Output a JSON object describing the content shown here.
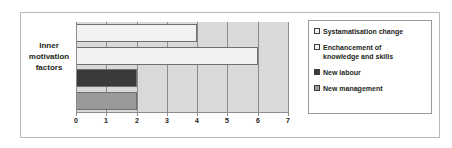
{
  "chart_data": {
    "type": "bar",
    "orientation": "horizontal",
    "title": "",
    "xlabel": "",
    "ylabel": "",
    "categories": [
      "Inner motivation factors"
    ],
    "series": [
      {
        "name": "Systamatisation change",
        "values": [
          4
        ],
        "color": "#f2f2f2"
      },
      {
        "name": "Enchancement of knowledge and skills",
        "values": [
          6
        ],
        "color": "#f2f2f2"
      },
      {
        "name": "New labour",
        "values": [
          2
        ],
        "color": "#3a3a3a"
      },
      {
        "name": "New management",
        "values": [
          2
        ],
        "color": "#9a9a9a"
      }
    ],
    "xlim": [
      0,
      7
    ],
    "xticks": [
      0,
      1,
      2,
      3,
      4,
      5,
      6,
      7
    ],
    "xtick_labels": [
      "0",
      "1",
      "2",
      "3",
      "4",
      "5",
      "6",
      "7"
    ],
    "grid": true,
    "grid_axis": "x",
    "legend_position": "right",
    "plot_background": "#d9d9d9"
  },
  "axis": {
    "category_label_lines": [
      "Inner",
      "motivation",
      "factors"
    ],
    "tick_labels": [
      "0",
      "1",
      "2",
      "3",
      "4",
      "5",
      "6",
      "7"
    ]
  },
  "legend": {
    "items": [
      {
        "label": "Systamatisation change",
        "label_line2": ""
      },
      {
        "label": "Enchancement of",
        "label_line2": "knowledge and skills"
      },
      {
        "label": "New labour",
        "label_line2": ""
      },
      {
        "label": "New management",
        "label_line2": ""
      }
    ]
  },
  "colors": {
    "plot_background": "#d9d9d9",
    "bar_light": "#f2f2f2",
    "bar_dark": "#3a3a3a",
    "bar_gray": "#9a9a9a",
    "gridline": "#8c8c8c",
    "frame": "#b9b9b9"
  }
}
